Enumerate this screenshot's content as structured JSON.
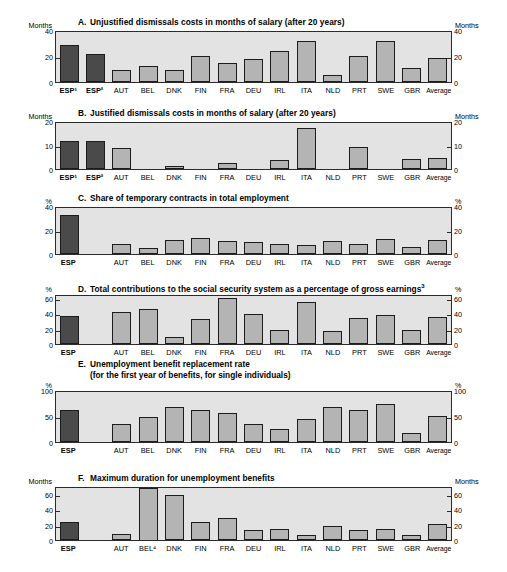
{
  "figure": {
    "title": "",
    "panel_count": 6
  },
  "chart_data": [
    {
      "type": "bar",
      "panel": "A",
      "letter": "A.",
      "title": "Unjustified dismissals costs in months of salary (after 20 years)",
      "ylabel": "Months",
      "ylabel_right": "Months",
      "ylim": [
        0,
        40
      ],
      "yticks": [
        0,
        20,
        40
      ],
      "ytick_labels": [
        "0",
        "20",
        "40"
      ],
      "categories": [
        "ESP¹",
        "ESP²",
        "AUT",
        "BEL",
        "DNK",
        "FIN",
        "FRA",
        "DEU",
        "IRL",
        "ITA",
        "NLD",
        "PRT",
        "SWE",
        "GBR",
        "Average"
      ],
      "values": [
        30,
        22.5,
        9.5,
        13,
        9.5,
        20.5,
        15.5,
        18.5,
        24.5,
        33,
        5.5,
        20.5,
        33,
        11.5,
        19
      ],
      "highlight_indices": [
        0,
        1
      ],
      "gap_after": [],
      "grid": false,
      "legend": "none"
    },
    {
      "type": "bar",
      "panel": "B",
      "letter": "B.",
      "title": "Justified dismissals costs in months of salary (after 20 years)",
      "ylabel": "Months",
      "ylabel_right": "Months",
      "ylim": [
        0,
        20
      ],
      "yticks": [
        0,
        10,
        20
      ],
      "ytick_labels": [
        "0",
        "10",
        "20"
      ],
      "categories": [
        "ESP¹",
        "ESP²",
        "AUT",
        "BEL",
        "DNK",
        "FIN",
        "FRA",
        "DEU",
        "IRL",
        "ITA",
        "NLD",
        "PRT",
        "SWE",
        "GBR",
        "Average"
      ],
      "values": [
        12,
        12,
        9,
        0,
        1.3,
        0,
        2.6,
        0,
        4,
        18,
        0,
        9.5,
        0,
        4.5,
        4.8
      ],
      "highlight_indices": [
        0,
        1
      ],
      "gap_after": [],
      "grid": false,
      "legend": "none"
    },
    {
      "type": "bar",
      "panel": "C",
      "letter": "C.",
      "title": "Share of temporary contracts in total employment",
      "ylabel": "%",
      "ylabel_right": "%",
      "ylim": [
        0,
        40
      ],
      "yticks": [
        0,
        20,
        40
      ],
      "ytick_labels": [
        "0",
        "20",
        "40"
      ],
      "categories": [
        "ESP",
        "",
        "AUT",
        "BEL",
        "DNK",
        "FIN",
        "FRA",
        "DEU",
        "IRL",
        "ITA",
        "NLD",
        "PRT",
        "SWE",
        "GBR",
        "Average"
      ],
      "values": [
        34,
        null,
        8.5,
        5,
        12,
        14,
        11,
        10.5,
        9,
        7.5,
        11.5,
        9,
        13,
        6,
        12
      ],
      "highlight_indices": [
        0
      ],
      "gap_after": [
        0
      ],
      "grid": false,
      "legend": "none"
    },
    {
      "type": "bar",
      "panel": "D",
      "letter": "D.",
      "title": "Total contributions to the social security system as a percentage of gross earnings",
      "title_sup": "3",
      "ylabel": "%",
      "ylabel_right": "%",
      "ylim": [
        0,
        65
      ],
      "yticks": [
        0,
        20,
        40,
        60
      ],
      "ytick_labels": [
        "0",
        "20",
        "40",
        "60"
      ],
      "categories": [
        "ESP",
        "",
        "AUT",
        "BEL",
        "DNK",
        "FIN",
        "FRA",
        "DEU",
        "IRL",
        "ITA",
        "NLD",
        "PRT",
        "SWE",
        "GBR",
        "Average"
      ],
      "values": [
        38,
        null,
        43,
        48,
        9,
        34,
        62,
        41,
        19,
        57,
        18,
        35,
        39,
        19,
        36
      ],
      "highlight_indices": [
        0
      ],
      "gap_after": [
        0
      ],
      "grid": false,
      "legend": "none"
    },
    {
      "type": "bar",
      "panel": "E",
      "letter": "E.",
      "title": "Unemployment benefit replacement rate",
      "title_line2": "(for the first year of benefits, for single individuals)",
      "ylabel": "%",
      "ylabel_right": "%",
      "ylim": [
        0,
        100
      ],
      "yticks": [
        0,
        50,
        100
      ],
      "ytick_labels": [
        "0",
        "50",
        "100"
      ],
      "categories": [
        "ESP",
        "",
        "AUT",
        "BEL",
        "DNK",
        "FIN",
        "FRA",
        "DEU",
        "IRL",
        "ITA",
        "NLD",
        "PRT",
        "SWE",
        "GBR",
        "Average"
      ],
      "values": [
        65,
        null,
        36,
        51,
        71,
        65,
        58,
        36,
        27,
        46,
        70,
        65,
        76,
        19,
        53
      ],
      "highlight_indices": [
        0
      ],
      "gap_after": [
        0
      ],
      "grid": false,
      "legend": "none"
    },
    {
      "type": "bar",
      "panel": "F",
      "letter": "F.",
      "title": "Maximum duration for unemployment benefits",
      "ylabel": "Months",
      "ylabel_right": "Months",
      "ylim": [
        0,
        70
      ],
      "yticks": [
        0,
        20,
        40,
        60
      ],
      "ytick_labels": [
        "0",
        "20",
        "40",
        "60"
      ],
      "categories": [
        "ESP",
        "",
        "AUT",
        "BEL⁴",
        "DNK",
        "FIN",
        "FRA",
        "DEU",
        "IRL",
        "ITA",
        "NLD",
        "PRT",
        "SWE",
        "GBR",
        "Average"
      ],
      "values": [
        24,
        null,
        8,
        70,
        60,
        24,
        30,
        13,
        15,
        7,
        19,
        14,
        15,
        7,
        22
      ],
      "highlight_indices": [
        0
      ],
      "gap_after": [
        0
      ],
      "grid": false,
      "legend": "none"
    }
  ],
  "colors": {
    "plot_background": "#e3e3e3",
    "bar_fill": "#b4b4b4",
    "bar_highlight_fill": "#4a4a4a",
    "bar_stroke": "#1c1c1c",
    "axis": "#2b2b2b",
    "text": "#000000"
  }
}
